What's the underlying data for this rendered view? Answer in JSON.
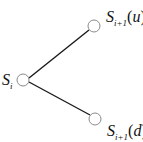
{
  "diagram": {
    "type": "binomial-tree",
    "nodes": [
      {
        "id": "root",
        "label_main": "S",
        "label_sub": "i",
        "label_arg": ""
      },
      {
        "id": "up",
        "label_main": "S",
        "label_sub": "i+1",
        "label_arg": "u"
      },
      {
        "id": "down",
        "label_main": "S",
        "label_sub": "i+1",
        "label_arg": "d"
      }
    ],
    "edges": [
      {
        "from": "root",
        "to": "up"
      },
      {
        "from": "root",
        "to": "down"
      }
    ],
    "colors": {
      "edge": "#1a1a1a",
      "node_stroke": "#8a8a8a",
      "node_fill": "#ffffff",
      "text": "#111111"
    }
  }
}
